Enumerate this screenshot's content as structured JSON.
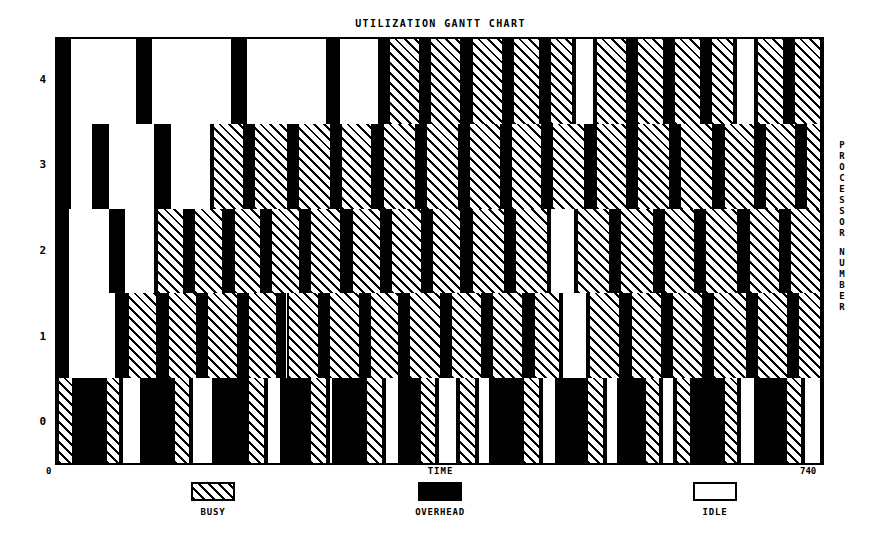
{
  "chart_data": {
    "type": "gantt",
    "title": "UTILIZATION GANTT CHART",
    "xlabel": "TIME",
    "ylabel": "PROCESSOR NUMBER",
    "xlim": [
      0,
      740
    ],
    "x_min_label": "0",
    "x_max_label": "740",
    "ytick_labels": [
      "4",
      "3",
      "2",
      "1",
      "0"
    ],
    "grid": false,
    "legend_position": "bottom",
    "states": [
      {
        "key": "busy",
        "label": "BUSY",
        "fill": "hatch",
        "color": "#000000"
      },
      {
        "key": "overhead",
        "label": "OVERHEAD",
        "fill": "solid",
        "color": "#000000"
      },
      {
        "key": "idle",
        "label": "IDLE",
        "fill": "empty",
        "color": "#ffffff"
      }
    ],
    "rows": [
      {
        "processor": "4",
        "segments": [
          {
            "state": "overhead",
            "start": 0,
            "end": 12
          },
          {
            "state": "idle",
            "start": 12,
            "end": 78
          },
          {
            "state": "overhead",
            "start": 78,
            "end": 90
          },
          {
            "state": "idle",
            "start": 90,
            "end": 170
          },
          {
            "state": "overhead",
            "start": 170,
            "end": 182
          },
          {
            "state": "idle",
            "start": 182,
            "end": 262
          },
          {
            "state": "overhead",
            "start": 262,
            "end": 272
          },
          {
            "state": "idle",
            "start": 272,
            "end": 312
          },
          {
            "state": "overhead",
            "start": 312,
            "end": 320
          },
          {
            "state": "busy",
            "start": 320,
            "end": 352
          },
          {
            "state": "overhead",
            "start": 352,
            "end": 360
          },
          {
            "state": "busy",
            "start": 360,
            "end": 392
          },
          {
            "state": "overhead",
            "start": 392,
            "end": 400
          },
          {
            "state": "busy",
            "start": 400,
            "end": 432
          },
          {
            "state": "overhead",
            "start": 432,
            "end": 440
          },
          {
            "state": "busy",
            "start": 440,
            "end": 468
          },
          {
            "state": "overhead",
            "start": 468,
            "end": 476
          },
          {
            "state": "busy",
            "start": 476,
            "end": 500
          },
          {
            "state": "idle",
            "start": 500,
            "end": 520
          },
          {
            "state": "busy",
            "start": 520,
            "end": 552
          },
          {
            "state": "overhead",
            "start": 552,
            "end": 560
          },
          {
            "state": "busy",
            "start": 560,
            "end": 588
          },
          {
            "state": "overhead",
            "start": 588,
            "end": 596
          },
          {
            "state": "busy",
            "start": 596,
            "end": 624
          },
          {
            "state": "overhead",
            "start": 624,
            "end": 632
          },
          {
            "state": "busy",
            "start": 632,
            "end": 656
          },
          {
            "state": "idle",
            "start": 656,
            "end": 676
          },
          {
            "state": "busy",
            "start": 676,
            "end": 704
          },
          {
            "state": "overhead",
            "start": 704,
            "end": 712
          },
          {
            "state": "busy",
            "start": 712,
            "end": 740
          }
        ]
      },
      {
        "processor": "3",
        "segments": [
          {
            "state": "overhead",
            "start": 0,
            "end": 12
          },
          {
            "state": "idle",
            "start": 12,
            "end": 36
          },
          {
            "state": "overhead",
            "start": 36,
            "end": 48
          },
          {
            "state": "idle",
            "start": 48,
            "end": 96
          },
          {
            "state": "overhead",
            "start": 96,
            "end": 108
          },
          {
            "state": "idle",
            "start": 108,
            "end": 150
          },
          {
            "state": "busy",
            "start": 150,
            "end": 182
          },
          {
            "state": "overhead",
            "start": 182,
            "end": 190
          },
          {
            "state": "busy",
            "start": 190,
            "end": 224
          },
          {
            "state": "overhead",
            "start": 224,
            "end": 232
          },
          {
            "state": "busy",
            "start": 232,
            "end": 266
          },
          {
            "state": "overhead",
            "start": 266,
            "end": 274
          },
          {
            "state": "busy",
            "start": 274,
            "end": 306
          },
          {
            "state": "overhead",
            "start": 306,
            "end": 314
          },
          {
            "state": "busy",
            "start": 314,
            "end": 348
          },
          {
            "state": "overhead",
            "start": 348,
            "end": 356
          },
          {
            "state": "busy",
            "start": 356,
            "end": 390
          },
          {
            "state": "overhead",
            "start": 390,
            "end": 398
          },
          {
            "state": "busy",
            "start": 398,
            "end": 430
          },
          {
            "state": "overhead",
            "start": 430,
            "end": 438
          },
          {
            "state": "busy",
            "start": 438,
            "end": 470
          },
          {
            "state": "overhead",
            "start": 470,
            "end": 478
          },
          {
            "state": "busy",
            "start": 478,
            "end": 512
          },
          {
            "state": "overhead",
            "start": 512,
            "end": 520
          },
          {
            "state": "busy",
            "start": 520,
            "end": 552
          },
          {
            "state": "overhead",
            "start": 552,
            "end": 560
          },
          {
            "state": "busy",
            "start": 560,
            "end": 594
          },
          {
            "state": "overhead",
            "start": 594,
            "end": 602
          },
          {
            "state": "busy",
            "start": 602,
            "end": 636
          },
          {
            "state": "overhead",
            "start": 636,
            "end": 644
          },
          {
            "state": "busy",
            "start": 644,
            "end": 676
          },
          {
            "state": "overhead",
            "start": 676,
            "end": 684
          },
          {
            "state": "busy",
            "start": 684,
            "end": 716
          },
          {
            "state": "overhead",
            "start": 716,
            "end": 724
          },
          {
            "state": "busy",
            "start": 724,
            "end": 740
          }
        ]
      },
      {
        "processor": "2",
        "segments": [
          {
            "state": "overhead",
            "start": 0,
            "end": 10
          },
          {
            "state": "idle",
            "start": 10,
            "end": 52
          },
          {
            "state": "overhead",
            "start": 52,
            "end": 64
          },
          {
            "state": "idle",
            "start": 64,
            "end": 96
          },
          {
            "state": "busy",
            "start": 96,
            "end": 124
          },
          {
            "state": "overhead",
            "start": 124,
            "end": 132
          },
          {
            "state": "busy",
            "start": 132,
            "end": 162
          },
          {
            "state": "overhead",
            "start": 162,
            "end": 170
          },
          {
            "state": "busy",
            "start": 170,
            "end": 198
          },
          {
            "state": "overhead",
            "start": 198,
            "end": 206
          },
          {
            "state": "busy",
            "start": 206,
            "end": 236
          },
          {
            "state": "overhead",
            "start": 236,
            "end": 244
          },
          {
            "state": "busy",
            "start": 244,
            "end": 276
          },
          {
            "state": "overhead",
            "start": 276,
            "end": 284
          },
          {
            "state": "busy",
            "start": 284,
            "end": 314
          },
          {
            "state": "overhead",
            "start": 314,
            "end": 322
          },
          {
            "state": "busy",
            "start": 322,
            "end": 354
          },
          {
            "state": "overhead",
            "start": 354,
            "end": 362
          },
          {
            "state": "busy",
            "start": 362,
            "end": 392
          },
          {
            "state": "overhead",
            "start": 392,
            "end": 400
          },
          {
            "state": "busy",
            "start": 400,
            "end": 434
          },
          {
            "state": "overhead",
            "start": 434,
            "end": 442
          },
          {
            "state": "busy",
            "start": 442,
            "end": 476
          },
          {
            "state": "idle",
            "start": 476,
            "end": 502
          },
          {
            "state": "busy",
            "start": 502,
            "end": 536
          },
          {
            "state": "overhead",
            "start": 536,
            "end": 544
          },
          {
            "state": "busy",
            "start": 544,
            "end": 578
          },
          {
            "state": "overhead",
            "start": 578,
            "end": 586
          },
          {
            "state": "busy",
            "start": 586,
            "end": 618
          },
          {
            "state": "overhead",
            "start": 618,
            "end": 626
          },
          {
            "state": "busy",
            "start": 626,
            "end": 660
          },
          {
            "state": "overhead",
            "start": 660,
            "end": 668
          },
          {
            "state": "busy",
            "start": 668,
            "end": 700
          },
          {
            "state": "overhead",
            "start": 700,
            "end": 708
          },
          {
            "state": "busy",
            "start": 708,
            "end": 740
          }
        ]
      },
      {
        "processor": "1",
        "segments": [
          {
            "state": "overhead",
            "start": 0,
            "end": 10
          },
          {
            "state": "idle",
            "start": 10,
            "end": 58
          },
          {
            "state": "overhead",
            "start": 58,
            "end": 68
          },
          {
            "state": "busy",
            "start": 68,
            "end": 98
          },
          {
            "state": "overhead",
            "start": 98,
            "end": 106
          },
          {
            "state": "busy",
            "start": 106,
            "end": 136
          },
          {
            "state": "overhead",
            "start": 136,
            "end": 144
          },
          {
            "state": "busy",
            "start": 144,
            "end": 176
          },
          {
            "state": "overhead",
            "start": 176,
            "end": 184
          },
          {
            "state": "busy",
            "start": 184,
            "end": 214
          },
          {
            "state": "overhead",
            "start": 214,
            "end": 222
          },
          {
            "state": "busy",
            "start": 222,
            "end": 254
          },
          {
            "state": "overhead",
            "start": 254,
            "end": 262
          },
          {
            "state": "busy",
            "start": 262,
            "end": 294
          },
          {
            "state": "overhead",
            "start": 294,
            "end": 302
          },
          {
            "state": "busy",
            "start": 302,
            "end": 332
          },
          {
            "state": "overhead",
            "start": 332,
            "end": 340
          },
          {
            "state": "busy",
            "start": 340,
            "end": 372
          },
          {
            "state": "overhead",
            "start": 372,
            "end": 380
          },
          {
            "state": "busy",
            "start": 380,
            "end": 412
          },
          {
            "state": "overhead",
            "start": 412,
            "end": 420
          },
          {
            "state": "busy",
            "start": 420,
            "end": 452
          },
          {
            "state": "overhead",
            "start": 452,
            "end": 460
          },
          {
            "state": "busy",
            "start": 460,
            "end": 488
          },
          {
            "state": "idle",
            "start": 488,
            "end": 514
          },
          {
            "state": "busy",
            "start": 514,
            "end": 546
          },
          {
            "state": "overhead",
            "start": 546,
            "end": 554
          },
          {
            "state": "busy",
            "start": 554,
            "end": 586
          },
          {
            "state": "overhead",
            "start": 586,
            "end": 594
          },
          {
            "state": "busy",
            "start": 594,
            "end": 626
          },
          {
            "state": "overhead",
            "start": 626,
            "end": 634
          },
          {
            "state": "busy",
            "start": 634,
            "end": 668
          },
          {
            "state": "overhead",
            "start": 668,
            "end": 676
          },
          {
            "state": "busy",
            "start": 676,
            "end": 708
          },
          {
            "state": "overhead",
            "start": 708,
            "end": 716
          },
          {
            "state": "busy",
            "start": 716,
            "end": 740
          }
        ]
      },
      {
        "processor": "0",
        "segments": [
          {
            "state": "busy",
            "start": 0,
            "end": 16
          },
          {
            "state": "overhead",
            "start": 16,
            "end": 46
          },
          {
            "state": "busy",
            "start": 46,
            "end": 62
          },
          {
            "state": "idle",
            "start": 62,
            "end": 82
          },
          {
            "state": "overhead",
            "start": 82,
            "end": 112
          },
          {
            "state": "busy",
            "start": 112,
            "end": 130
          },
          {
            "state": "idle",
            "start": 130,
            "end": 152
          },
          {
            "state": "overhead",
            "start": 152,
            "end": 184
          },
          {
            "state": "busy",
            "start": 184,
            "end": 202
          },
          {
            "state": "idle",
            "start": 202,
            "end": 218
          },
          {
            "state": "overhead",
            "start": 218,
            "end": 244
          },
          {
            "state": "busy",
            "start": 244,
            "end": 262
          },
          {
            "state": "idle",
            "start": 262,
            "end": 268
          },
          {
            "state": "overhead",
            "start": 268,
            "end": 298
          },
          {
            "state": "busy",
            "start": 298,
            "end": 316
          },
          {
            "state": "idle",
            "start": 316,
            "end": 332
          },
          {
            "state": "overhead",
            "start": 332,
            "end": 350
          },
          {
            "state": "busy",
            "start": 350,
            "end": 368
          },
          {
            "state": "idle",
            "start": 368,
            "end": 388
          },
          {
            "state": "busy",
            "start": 388,
            "end": 406
          },
          {
            "state": "idle",
            "start": 406,
            "end": 420
          },
          {
            "state": "overhead",
            "start": 420,
            "end": 450
          },
          {
            "state": "busy",
            "start": 450,
            "end": 468
          },
          {
            "state": "idle",
            "start": 468,
            "end": 484
          },
          {
            "state": "overhead",
            "start": 484,
            "end": 512
          },
          {
            "state": "busy",
            "start": 512,
            "end": 530
          },
          {
            "state": "idle",
            "start": 530,
            "end": 544
          },
          {
            "state": "overhead",
            "start": 544,
            "end": 568
          },
          {
            "state": "busy",
            "start": 568,
            "end": 584
          },
          {
            "state": "idle",
            "start": 584,
            "end": 598
          },
          {
            "state": "busy",
            "start": 598,
            "end": 614
          },
          {
            "state": "overhead",
            "start": 614,
            "end": 644
          },
          {
            "state": "busy",
            "start": 644,
            "end": 660
          },
          {
            "state": "idle",
            "start": 660,
            "end": 676
          },
          {
            "state": "overhead",
            "start": 676,
            "end": 704
          },
          {
            "state": "busy",
            "start": 704,
            "end": 722
          },
          {
            "state": "idle",
            "start": 722,
            "end": 740
          }
        ]
      }
    ]
  }
}
